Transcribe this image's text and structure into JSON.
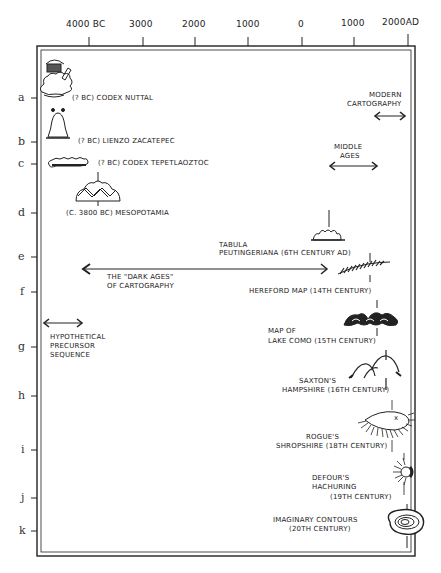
{
  "timeline_axis": {
    "ticks": [
      {
        "label": "4000 BC",
        "x": 89
      },
      {
        "label": "3000",
        "x": 143
      },
      {
        "label": "2000",
        "x": 195
      },
      {
        "label": "1000",
        "x": 248
      },
      {
        "label": "0",
        "x": 302
      },
      {
        "label": "1000",
        "x": 354
      },
      {
        "label": "2000AD",
        "x": 408
      }
    ]
  },
  "rows": [
    {
      "letter": "a",
      "y": 98,
      "label": "(? BC) CODEX NUTTAL"
    },
    {
      "letter": "b",
      "y": 142,
      "label": "(? BC) LIENZO ZACATEPEC"
    },
    {
      "letter": "c",
      "y": 164,
      "label": "(? BC) CODEX TEPETLAOZTOC"
    },
    {
      "letter": "d",
      "y": 213,
      "label": "(C. 3800 BC) MESOPOTAMIA"
    },
    {
      "letter": "e",
      "y": 257,
      "label_line1": "TABULA",
      "label_line2": "PEUTINGERIANA  (6TH CENTURY AD)"
    },
    {
      "letter": "f",
      "y": 292,
      "label": "HEREFORD MAP (14TH CENTURY)"
    },
    {
      "letter": "g",
      "y": 347,
      "label_line1": "MAP OF",
      "label_line2": "LAKE COMO (15TH CENTURY)"
    },
    {
      "letter": "h",
      "y": 396,
      "label_line1": "SAXTON'S",
      "label_line2": "HAMPSHIRE (16TH CENTURY)"
    },
    {
      "letter": "i",
      "y": 450,
      "label_line1": "ROGUE'S",
      "label_line2": "SHROPSHIRE (18TH CENTURY)"
    },
    {
      "letter": "j",
      "y": 498,
      "label_line1": "DEFOUR'S",
      "label_line2": "HACHURING",
      "label_line3": "(19TH CENTURY)"
    },
    {
      "letter": "k",
      "y": 531,
      "label_line1": "IMAGINARY CONTOURS",
      "label_line2": "(20TH CENTURY)"
    }
  ],
  "periods": {
    "modern": {
      "line1": "MODERN",
      "line2": "CARTOGRAPHY"
    },
    "middle": {
      "line1": "MIDDLE",
      "line2": "AGES"
    },
    "dark": {
      "line1": "THE \"DARK AGES\"",
      "line2": "OF CARTOGRAPHY"
    },
    "precursor": {
      "line1": "HYPOTHETICAL",
      "line2": "PRECURSOR",
      "line3": "SEQUENCE"
    }
  }
}
